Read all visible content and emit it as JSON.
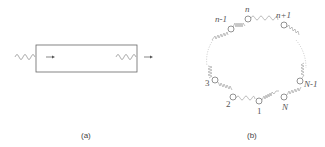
{
  "panel_a": {
    "caption": "(a)"
  },
  "panel_b": {
    "caption": "(b)",
    "node_labels": {
      "n_minus_1": "n-1",
      "n": "n",
      "n_plus_1": "n+1",
      "three": "3",
      "two": "2",
      "one": "1",
      "N": "N",
      "N_minus_1": "N-1"
    }
  },
  "colors": {
    "line": "#555555",
    "wave": "#999999",
    "dotted": "#bbbbbb"
  }
}
